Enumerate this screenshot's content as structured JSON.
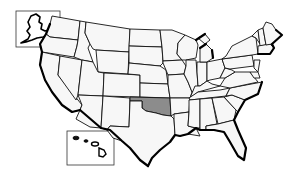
{
  "map": {
    "subject": "United States",
    "highlighted_state": "Oklahoma",
    "insets": [
      "Alaska",
      "Hawaii"
    ],
    "colors": {
      "highlight": "#8c8c8c",
      "state_fill": "#f7f7f7",
      "border": "#111111",
      "background": "#ffffff"
    }
  }
}
